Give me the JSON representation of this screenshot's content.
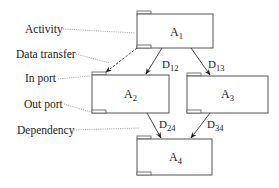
{
  "diagram": {
    "type": "activity-dependency-graph",
    "legend_labels": [
      {
        "id": "activity",
        "text": "Activity"
      },
      {
        "id": "data-transfer",
        "text": "Data transfer"
      },
      {
        "id": "in-port",
        "text": "In port"
      },
      {
        "id": "out-port",
        "text": "Out port"
      },
      {
        "id": "dependency",
        "text": "Dependency"
      }
    ],
    "activities": [
      {
        "id": "A1",
        "base": "A",
        "sub": "1"
      },
      {
        "id": "A2",
        "base": "A",
        "sub": "2"
      },
      {
        "id": "A3",
        "base": "A",
        "sub": "3"
      },
      {
        "id": "A4",
        "base": "A",
        "sub": "4"
      }
    ],
    "dependencies": [
      {
        "from": "A1",
        "to": "A2",
        "base": "D",
        "sub": "12"
      },
      {
        "from": "A1",
        "to": "A3",
        "base": "D",
        "sub": "13"
      },
      {
        "from": "A2",
        "to": "A4",
        "base": "D",
        "sub": "24"
      },
      {
        "from": "A3",
        "to": "A4",
        "base": "D",
        "sub": "34"
      }
    ],
    "data_transfers": [
      {
        "from": "A1.out_port",
        "to": "A2.in_port"
      }
    ]
  }
}
